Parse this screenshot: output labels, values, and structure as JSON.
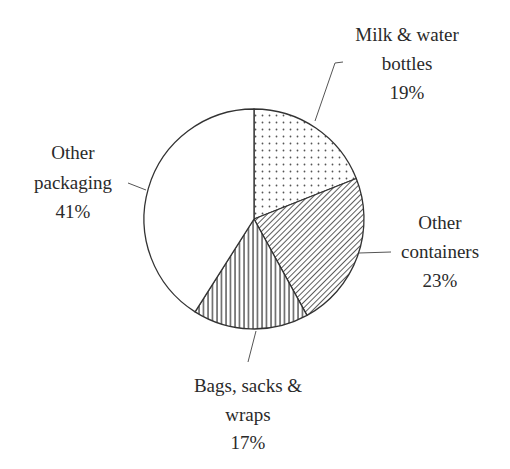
{
  "chart_data": {
    "type": "pie",
    "title": "",
    "start_angle_deg": 0,
    "direction": "clockwise",
    "slices": [
      {
        "label_lines": [
          "Milk & water",
          "bottles"
        ],
        "label": "Milk & water bottles",
        "value": 19,
        "value_text": "19%",
        "pattern": "dots"
      },
      {
        "label_lines": [
          "Other",
          "containers"
        ],
        "label": "Other containers",
        "value": 23,
        "value_text": "23%",
        "pattern": "diagonal-hatch"
      },
      {
        "label_lines": [
          "Bags, sacks &",
          "wraps"
        ],
        "label": "Bags, sacks & wraps",
        "value": 17,
        "value_text": "17%",
        "pattern": "vertical-lines"
      },
      {
        "label_lines": [
          "Other",
          "packaging"
        ],
        "label": "Other packaging",
        "value": 41,
        "value_text": "41%",
        "pattern": "none"
      }
    ],
    "colors": {
      "outline": "#333333",
      "fill": "#ffffff",
      "leader": "#555555"
    }
  }
}
